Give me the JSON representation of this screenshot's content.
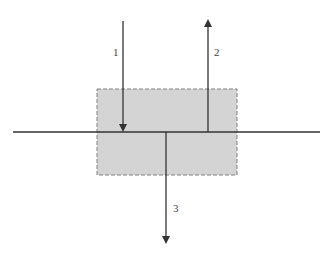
{
  "diagram": {
    "type": "force-arrows-across-boundary",
    "colors": {
      "background": "#ffffff",
      "box_fill": "#d4d4d4",
      "box_border": "#808080",
      "line": "#333333",
      "label": "#444444"
    },
    "box": {
      "x": 97,
      "y": 89,
      "width": 140,
      "height": 86,
      "border_style": "dashed"
    },
    "horizontal_line": {
      "x1": 13,
      "x2": 320,
      "y": 132
    },
    "arrows": [
      {
        "id": "1",
        "label": "1",
        "direction": "down",
        "x": 123,
        "y_start": 21,
        "y_end": 132,
        "label_x": 113,
        "label_y": 56
      },
      {
        "id": "2",
        "label": "2",
        "direction": "up",
        "x": 208,
        "y_start": 132,
        "y_end": 19,
        "label_x": 214,
        "label_y": 56
      },
      {
        "id": "3",
        "label": "3",
        "direction": "down",
        "x": 166,
        "y_start": 132,
        "y_end": 244,
        "label_x": 173,
        "label_y": 212
      }
    ]
  }
}
